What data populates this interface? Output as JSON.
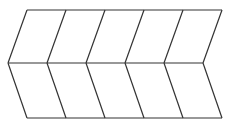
{
  "diagram": {
    "type": "chevron-grid",
    "columns": 5,
    "rows": 2,
    "stroke_color": "#333333",
    "background": "#ffffff",
    "geometry": {
      "top_y": 10,
      "mid_y": 63,
      "bottom_y": 118,
      "top_x": [
        27,
        66,
        105,
        144,
        183,
        222
      ],
      "mid_x": [
        8,
        47,
        86,
        125,
        164,
        203
      ]
    }
  },
  "caption": {
    "text": "Figure 1 (clipped)"
  }
}
